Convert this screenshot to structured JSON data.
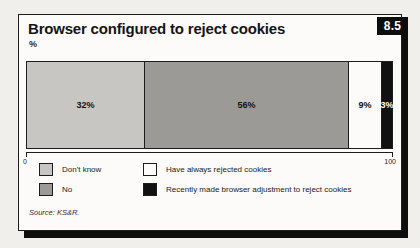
{
  "figure": {
    "number": "8.5",
    "source": "Source: KS&R."
  },
  "chart_data": {
    "type": "bar",
    "subtype": "stacked-horizontal",
    "title": "Browser configured to reject cookies",
    "ylabel_unit": "%",
    "categories": [
      "Don't know",
      "No",
      "Have always rejected cookies",
      "Recently made browser adjustment to reject cookies"
    ],
    "values": [
      32,
      56,
      9,
      3
    ],
    "display_labels": [
      "32%",
      "56%",
      "9%",
      "3%"
    ],
    "colors": [
      "#c7c6c3",
      "#9b9a97",
      "#fcfbf9",
      "#111111"
    ],
    "label_text_colors": [
      "#141414",
      "#141414",
      "#141414",
      "#ffffff"
    ],
    "xlim": [
      0,
      100
    ],
    "axis_tick_labels": {
      "min": "0",
      "max": "100"
    },
    "legend_position": "bottom",
    "grid": false
  }
}
